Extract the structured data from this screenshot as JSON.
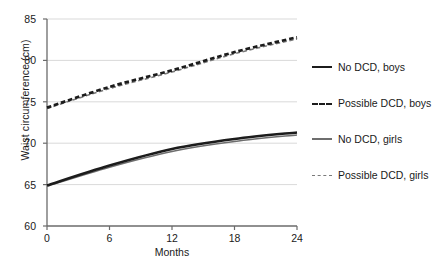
{
  "chart_data": {
    "type": "line",
    "title": "",
    "xlabel": "Months",
    "ylabel": "Waist circumference (cm)",
    "xlim": [
      0,
      24
    ],
    "ylim": [
      60,
      85
    ],
    "xticks": [
      "0",
      "6",
      "12",
      "18",
      "24"
    ],
    "yticks": [
      "60",
      "65",
      "70",
      "75",
      "80",
      "85"
    ],
    "grid": "horizontal",
    "legend_position": "right",
    "x": [
      0,
      6,
      12,
      18,
      24
    ],
    "series": [
      {
        "name": "No DCD, boys",
        "style": "solid",
        "color": "#1c1c1c",
        "width": "thick",
        "values": [
          64.9,
          67.3,
          69.3,
          70.5,
          71.3
        ]
      },
      {
        "name": "Possible DCD, boys",
        "style": "dashed",
        "color": "#1c1c1c",
        "width": "thick",
        "values": [
          74.3,
          76.8,
          78.8,
          81.0,
          82.8
        ]
      },
      {
        "name": "No DCD, girls",
        "style": "solid",
        "color": "#6e6e6e",
        "width": "thin",
        "values": [
          64.8,
          67.1,
          69.0,
          70.2,
          71.0
        ]
      },
      {
        "name": "Possible DCD, girls",
        "style": "dashed",
        "color": "#7a7a7a",
        "width": "thin",
        "values": [
          74.2,
          76.6,
          78.6,
          80.8,
          82.6
        ]
      }
    ]
  },
  "legend": {
    "items": [
      {
        "label": "No DCD, boys"
      },
      {
        "label": "Possible DCD, boys"
      },
      {
        "label": "No DCD, girls"
      },
      {
        "label": "Possible DCD, girls"
      }
    ]
  },
  "axes": {
    "y_title": "Waist circumference (cm)",
    "x_title": "Months",
    "y_tick_labels": [
      "85",
      "80",
      "75",
      "70",
      "65",
      "60"
    ],
    "x_tick_labels": [
      "0",
      "6",
      "12",
      "18",
      "24"
    ]
  }
}
